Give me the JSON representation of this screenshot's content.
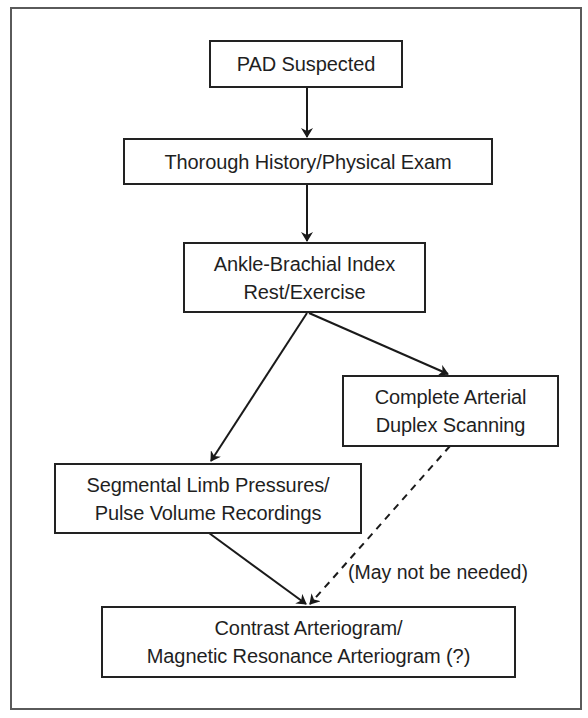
{
  "diagram": {
    "type": "flowchart",
    "nodes": {
      "pad_suspected": {
        "lines": [
          "PAD Suspected"
        ]
      },
      "history_exam": {
        "lines": [
          "Thorough History/Physical Exam"
        ]
      },
      "abi": {
        "lines": [
          "Ankle-Brachial Index",
          "Rest/Exercise"
        ]
      },
      "duplex": {
        "lines": [
          "Complete Arterial",
          "Duplex Scanning"
        ]
      },
      "segmental": {
        "lines": [
          "Segmental Limb Pressures/",
          "Pulse Volume Recordings"
        ]
      },
      "arteriogram": {
        "lines": [
          "Contrast Arteriogram/",
          "Magnetic Resonance Arteriogram (?)"
        ]
      }
    },
    "edges": [
      {
        "from": "pad_suspected",
        "to": "history_exam",
        "style": "solid"
      },
      {
        "from": "history_exam",
        "to": "abi",
        "style": "solid"
      },
      {
        "from": "abi",
        "to": "segmental",
        "style": "solid"
      },
      {
        "from": "abi",
        "to": "duplex",
        "style": "solid"
      },
      {
        "from": "segmental",
        "to": "arteriogram",
        "style": "solid"
      },
      {
        "from": "duplex",
        "to": "arteriogram",
        "style": "dashed",
        "label": "(May not be needed)"
      }
    ],
    "annotation": "(May not be needed)",
    "colors": {
      "stroke": "#222222",
      "frame": "#5a5a5a",
      "text": "#1f1f1f",
      "background": "#ffffff"
    }
  }
}
